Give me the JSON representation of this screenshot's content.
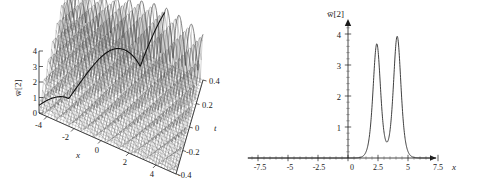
{
  "figure": {
    "background": "#ffffff",
    "ink_color": "#1a1a1a",
    "panels": [
      {
        "id": "panel-3d",
        "type": "surface-3d",
        "zlabel": "w̅[2]",
        "xlabel": "x",
        "ylabel": "t",
        "z_ticks": [
          "0",
          "1",
          "2",
          "3",
          "4"
        ],
        "x_ticks": [
          "-4",
          "-2",
          "0",
          "2",
          "4"
        ],
        "t_ticks": [
          "0.4",
          "0.2",
          "0",
          "-0.2",
          "-0.4"
        ]
      },
      {
        "id": "panel-2d",
        "type": "line",
        "ylabel": "w̅[2]",
        "xlabel": "x",
        "x_ticks": [
          "-7.5",
          "-5",
          "-2.5",
          "0",
          "2.5",
          "5",
          "7.5"
        ],
        "y_ticks": [
          "1",
          "2",
          "3",
          "4"
        ]
      }
    ]
  },
  "chart_data": [
    {
      "type": "surface",
      "title": "",
      "xlabel": "x",
      "ylabel": "t",
      "zlabel": "w̅[2]",
      "xlim": [
        -5,
        5
      ],
      "ylim": [
        -0.4,
        0.4
      ],
      "zlim": [
        0,
        4.2
      ],
      "x_ticks": [
        -4,
        -2,
        0,
        2,
        4
      ],
      "y_ticks": [
        0.4,
        0.2,
        0,
        -0.2,
        -0.4
      ],
      "z_ticks": [
        0,
        1,
        2,
        3,
        4
      ],
      "grid": false,
      "legend": "none",
      "description": "Periodic breather-like surface w̅[2](x,t): a dense train of sharp oscillatory crests along x whose amplitude envelope grows from the far x-edge toward a maximum ridge, with a pronounced dark crest line running diagonally across the surface.",
      "envelope_peak_amplitude": 4.0,
      "oscillation_count_along_x": 34,
      "ridge_present": true
    },
    {
      "type": "line",
      "title": "",
      "xlabel": "x",
      "ylabel": "w̅[2]",
      "xlim": [
        -9,
        9
      ],
      "ylim": [
        0,
        4.3
      ],
      "x_ticks": [
        -7.5,
        -5,
        -2.5,
        0,
        2.5,
        5,
        7.5
      ],
      "y_ticks": [
        1,
        2,
        3,
        4
      ],
      "grid": false,
      "legend": "none",
      "series": [
        {
          "name": "w̅[2]",
          "peaks": [
            {
              "x": 2.4,
              "y": 3.68,
              "width": 0.42
            },
            {
              "x": 4.1,
              "y": 3.92,
              "width": 0.42
            }
          ],
          "baseline": 0.0,
          "x": [
            -9,
            -8,
            -7,
            -6,
            -5,
            -4,
            -3,
            -2,
            -1,
            0,
            0.6,
            1.0,
            1.2,
            1.4,
            1.6,
            1.8,
            2.0,
            2.2,
            2.4,
            2.6,
            2.8,
            3.0,
            3.2,
            3.4,
            3.6,
            3.8,
            4.0,
            4.1,
            4.3,
            4.5,
            4.7,
            4.9,
            5.1,
            5.4,
            5.8,
            6.2,
            7.0,
            8.0,
            9.0
          ],
          "values": [
            0,
            0,
            0,
            0,
            0,
            0,
            0,
            0,
            0.01,
            0.03,
            0.07,
            0.16,
            0.28,
            0.55,
            1.05,
            1.95,
            2.95,
            3.55,
            3.68,
            3.3,
            2.35,
            1.25,
            0.62,
            0.46,
            0.8,
            2.0,
            3.6,
            3.92,
            3.5,
            2.35,
            1.15,
            0.45,
            0.17,
            0.06,
            0.02,
            0.01,
            0,
            0,
            0
          ]
        }
      ]
    }
  ]
}
